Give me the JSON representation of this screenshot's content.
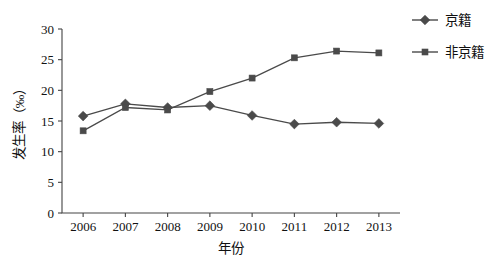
{
  "chart_data": {
    "type": "line",
    "title": "",
    "xlabel": "年份",
    "ylabel": "发生率（‰）",
    "categories": [
      "2006",
      "2007",
      "2008",
      "2009",
      "2010",
      "2011",
      "2012",
      "2013"
    ],
    "x": [
      2006,
      2007,
      2008,
      2009,
      2010,
      2011,
      2012,
      2013
    ],
    "xlim": [
      2005.5,
      2013.5
    ],
    "ylim": [
      0,
      30
    ],
    "yticks": [
      0,
      5,
      10,
      15,
      20,
      25,
      30
    ],
    "ytick_labels": [
      "0",
      "5",
      "10",
      "15",
      "20",
      "25",
      "30"
    ],
    "grid": false,
    "legend_position": "top-right",
    "series": [
      {
        "name": "京籍",
        "marker": "diamond",
        "color": "#4a4a4a",
        "values": [
          15.8,
          17.8,
          17.2,
          17.5,
          15.9,
          14.5,
          14.8,
          14.6
        ]
      },
      {
        "name": "非京籍",
        "marker": "square",
        "color": "#4a4a4a",
        "values": [
          13.4,
          17.2,
          16.8,
          19.8,
          22.0,
          25.3,
          26.4,
          26.1
        ]
      }
    ]
  },
  "legend": {
    "items": [
      {
        "label": "京籍",
        "marker": "diamond"
      },
      {
        "label": "非京籍",
        "marker": "square"
      }
    ]
  },
  "axes": {
    "x_title": "年份",
    "y_title": "发生率（‰）"
  }
}
